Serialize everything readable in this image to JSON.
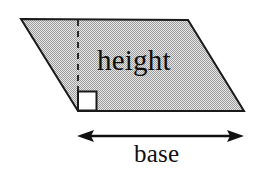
{
  "figure": {
    "background_color": "#ffffff",
    "stroke_color": "#1a1a1a",
    "fill_color": "#c8c8c8",
    "fill_pattern": "50-percent-dither-checkerboard",
    "pattern_light": "#e8e8e8",
    "pattern_dark": "#9a9a9a"
  },
  "labels": {
    "height": "height",
    "base": "base"
  },
  "shape": {
    "name": "parallelogram",
    "vertices": [
      {
        "x": 21,
        "y": 19
      },
      {
        "x": 188,
        "y": 20
      },
      {
        "x": 244,
        "y": 111
      },
      {
        "x": 78,
        "y": 111
      }
    ]
  },
  "height_line": {
    "style": "dashed",
    "from": {
      "x": 78,
      "y": 20
    },
    "to": {
      "x": 78,
      "y": 111
    }
  },
  "right_angle_marker": {
    "x": 78,
    "y": 91,
    "size": 19,
    "fill": "#ffffff"
  },
  "base_arrow": {
    "style": "double-headed",
    "from": {
      "x": 78,
      "y": 136
    },
    "to": {
      "x": 243,
      "y": 136
    }
  }
}
